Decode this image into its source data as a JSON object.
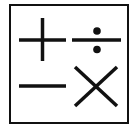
{
  "icon": {
    "name": "calculator-operations-icon",
    "symbols": [
      "plus",
      "divide",
      "minus",
      "multiply"
    ],
    "stroke_color": "#111111",
    "background_color": "#ffffff"
  }
}
